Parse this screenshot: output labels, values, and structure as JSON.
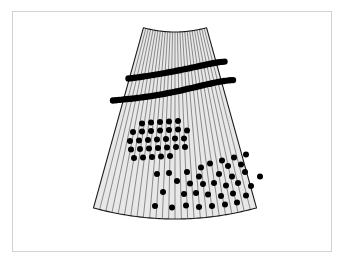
{
  "figure": {
    "frame": {
      "x": 12,
      "y": 11,
      "width": 320,
      "height": 241,
      "border_color": "#d2d2d2",
      "background_color": "#ffffff"
    },
    "sector": {
      "label": "annular-sector-detector",
      "fill_color": "#e8e8e8",
      "outline_color": "#1a1a1a",
      "outline_width": 1.1,
      "apex_x": 175.0,
      "apex_y": -86.0,
      "inner_radius": 118.0,
      "outer_radius": 305.0,
      "start_angle_deg": 74.5,
      "end_angle_deg": 105.5,
      "top_left": [
        141,
        32
      ],
      "top_right": [
        206,
        32
      ],
      "bottom_left": [
        52,
        210
      ],
      "bottom_right": [
        299,
        212
      ]
    },
    "strips": {
      "label": "radial-strip-lines",
      "count": 26,
      "color": "#6b6b6b",
      "width": 0.75
    },
    "dots": {
      "label": "hit-markers",
      "color": "#000000",
      "radius_small": 2.7,
      "radius_large": 3.3,
      "total_count": 146
    }
  },
  "chart_data": {
    "type": "scatter",
    "xlabel": "",
    "ylabel": "",
    "xlim": [
      0,
      345
    ],
    "ylim": [
      0,
      266
    ],
    "grid": false,
    "legend": null,
    "series": [
      {
        "name": "arc-band-upper",
        "marker": "filled-circle",
        "color": "#000000",
        "radius": 3.2,
        "points": [
          [
            128.5,
            78.5
          ],
          [
            131.5,
            78.2
          ],
          [
            134.5,
            77.8
          ],
          [
            137.5,
            77.4
          ],
          [
            140.5,
            77.0
          ],
          [
            143.5,
            76.5
          ],
          [
            146.5,
            76.1
          ],
          [
            149.5,
            75.6
          ],
          [
            152.5,
            75.1
          ],
          [
            155.5,
            74.6
          ],
          [
            158.5,
            74.1
          ],
          [
            161.5,
            73.6
          ],
          [
            164.5,
            73.1
          ],
          [
            167.5,
            72.5
          ],
          [
            170.5,
            72.0
          ],
          [
            173.5,
            71.4
          ],
          [
            176.5,
            70.8
          ],
          [
            179.5,
            70.2
          ],
          [
            182.5,
            69.6
          ],
          [
            185.5,
            69.0
          ],
          [
            188.5,
            68.4
          ],
          [
            191.5,
            67.8
          ],
          [
            194.5,
            67.1
          ],
          [
            197.5,
            66.5
          ],
          [
            200.5,
            65.8
          ],
          [
            203.5,
            65.2
          ],
          [
            206.5,
            64.5
          ],
          [
            209.5,
            63.9
          ],
          [
            212.5,
            63.3
          ],
          [
            215.5,
            62.8
          ],
          [
            218.5,
            62.3
          ],
          [
            221.5,
            61.9
          ],
          [
            224.5,
            61.6
          ]
        ]
      },
      {
        "name": "arc-band-lower",
        "marker": "filled-circle",
        "color": "#000000",
        "radius": 3.2,
        "points": [
          [
            113.0,
            100.5
          ],
          [
            116.0,
            100.2
          ],
          [
            119.0,
            99.9
          ],
          [
            122.0,
            99.6
          ],
          [
            125.0,
            99.3
          ],
          [
            128.0,
            99.0
          ],
          [
            131.0,
            98.7
          ],
          [
            134.0,
            98.4
          ],
          [
            137.0,
            98.0
          ],
          [
            140.0,
            97.6
          ],
          [
            143.0,
            97.2
          ],
          [
            146.0,
            96.8
          ],
          [
            149.0,
            96.4
          ],
          [
            152.0,
            95.9
          ],
          [
            155.0,
            95.4
          ],
          [
            158.0,
            94.9
          ],
          [
            161.0,
            94.4
          ],
          [
            164.0,
            93.9
          ],
          [
            167.0,
            93.3
          ],
          [
            170.0,
            92.7
          ],
          [
            173.0,
            92.1
          ],
          [
            176.0,
            91.5
          ],
          [
            179.0,
            90.9
          ],
          [
            182.0,
            90.2
          ],
          [
            185.0,
            89.5
          ],
          [
            188.0,
            88.8
          ],
          [
            191.0,
            88.1
          ],
          [
            194.0,
            87.4
          ],
          [
            197.0,
            86.7
          ],
          [
            200.0,
            86.0
          ],
          [
            203.0,
            85.3
          ],
          [
            206.0,
            84.6
          ],
          [
            209.0,
            83.9
          ],
          [
            212.0,
            83.2
          ],
          [
            215.0,
            82.6
          ],
          [
            218.0,
            82.0
          ],
          [
            221.0,
            81.5
          ],
          [
            224.0,
            81.0
          ],
          [
            227.0,
            80.6
          ],
          [
            230.0,
            80.3
          ],
          [
            233.0,
            80.1
          ]
        ]
      },
      {
        "name": "cluster-grid",
        "marker": "filled-circle",
        "color": "#000000",
        "radius": 3.0,
        "points": [
          [
            142.0,
            123.5
          ],
          [
            151.0,
            122.5
          ],
          [
            160.0,
            122.0
          ],
          [
            169.0,
            121.5
          ],
          [
            178.0,
            121.0
          ],
          [
            133.0,
            132.0
          ],
          [
            142.0,
            131.5
          ],
          [
            151.0,
            131.0
          ],
          [
            160.0,
            130.5
          ],
          [
            169.0,
            130.0
          ],
          [
            178.0,
            129.5
          ],
          [
            187.0,
            130.5
          ],
          [
            130.0,
            141.0
          ],
          [
            139.0,
            140.5
          ],
          [
            148.0,
            140.0
          ],
          [
            157.0,
            139.5
          ],
          [
            166.0,
            139.0
          ],
          [
            175.0,
            138.5
          ],
          [
            184.0,
            138.5
          ],
          [
            131.0,
            149.5
          ],
          [
            140.0,
            149.0
          ],
          [
            149.0,
            148.5
          ],
          [
            158.0,
            148.0
          ],
          [
            167.0,
            147.5
          ],
          [
            176.0,
            147.0
          ],
          [
            185.0,
            147.0
          ],
          [
            134.0,
            158.0
          ],
          [
            143.0,
            157.5
          ],
          [
            152.0,
            157.0
          ],
          [
            161.0,
            156.5
          ],
          [
            170.0,
            156.0
          ]
        ]
      },
      {
        "name": "scatter-lower-right",
        "marker": "filled-circle",
        "color": "#000000",
        "radius": 3.0,
        "points": [
          [
            234.0,
            157.5
          ],
          [
            222.0,
            160.5
          ],
          [
            210.0,
            163.5
          ],
          [
            246.0,
            154.5
          ],
          [
            201.0,
            167.5
          ],
          [
            228.0,
            166.0
          ],
          [
            241.0,
            164.5
          ],
          [
            157.0,
            174.0
          ],
          [
            169.0,
            173.0
          ],
          [
            187.0,
            172.0
          ],
          [
            199.0,
            176.5
          ],
          [
            219.0,
            174.0
          ],
          [
            232.0,
            176.5
          ],
          [
            245.0,
            172.0
          ],
          [
            260.0,
            176.5
          ],
          [
            177.0,
            181.0
          ],
          [
            190.0,
            183.5
          ],
          [
            203.0,
            184.0
          ],
          [
            214.0,
            183.0
          ],
          [
            226.0,
            185.5
          ],
          [
            238.0,
            183.0
          ],
          [
            251.0,
            186.0
          ],
          [
            163.0,
            192.0
          ],
          [
            184.0,
            194.0
          ],
          [
            196.0,
            193.0
          ],
          [
            208.0,
            194.5
          ],
          [
            221.0,
            196.0
          ],
          [
            233.0,
            193.5
          ],
          [
            246.0,
            195.5
          ],
          [
            155.0,
            206.0
          ],
          [
            172.0,
            207.5
          ],
          [
            186.0,
            205.5
          ],
          [
            199.0,
            207.0
          ],
          [
            212.0,
            206.0
          ],
          [
            225.0,
            204.5
          ],
          [
            237.0,
            202.5
          ]
        ]
      }
    ]
  }
}
